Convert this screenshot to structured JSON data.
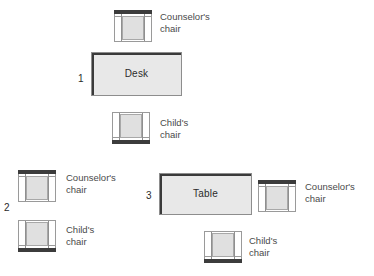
{
  "diagram": {
    "colors": {
      "furniture_fill": "#e8e8e8",
      "furniture_edge": "#8d8d8d",
      "furniture_shadow": "#3a3a3a",
      "chair_backrest": "#3c3c3c",
      "chair_seat": "#e0e0e0",
      "chair_outline": "#9a9a9a",
      "text": "#4a4a4a",
      "background": "#ffffff"
    },
    "groups": [
      {
        "number": "1",
        "furniture_label": "Desk"
      },
      {
        "number": "2",
        "furniture_label": ""
      },
      {
        "number": "3",
        "furniture_label": "Table"
      }
    ],
    "furniture": [
      {
        "label": "Desk",
        "group": "1"
      },
      {
        "label": "Table",
        "group": "3"
      }
    ],
    "chairs": [
      {
        "label": "Counselor's\nchair",
        "group": "1",
        "orientation": "back-top"
      },
      {
        "label": "Child's\nchair",
        "group": "1",
        "orientation": "back-bottom"
      },
      {
        "label": "Counselor's\nchair",
        "group": "2",
        "orientation": "back-top"
      },
      {
        "label": "Child's\nchair",
        "group": "2",
        "orientation": "back-bottom"
      },
      {
        "label": "Counselor's\nchair",
        "group": "3",
        "orientation": "back-top"
      },
      {
        "label": "Child's\nchair",
        "group": "3",
        "orientation": "back-bottom"
      }
    ],
    "labels": {
      "counselors_chair": "Counselor's\nchair",
      "childs_chair": "Child's\nchair",
      "desk": "Desk",
      "table": "Table",
      "group_one": "1",
      "group_two": "2",
      "group_three": "3"
    }
  }
}
